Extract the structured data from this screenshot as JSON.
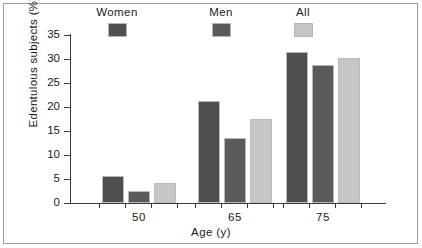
{
  "chart_data": {
    "type": "bar",
    "title": "",
    "subtitle": "",
    "xlabel": "Age (y)",
    "ylabel": "Edentulous subjects (%)",
    "categories": [
      "50",
      "65",
      "75"
    ],
    "series": [
      {
        "name": "Women",
        "color": "#4f4f4f",
        "values": [
          5.7,
          21.2,
          31.4
        ]
      },
      {
        "name": "Men",
        "color": "#5a5a5a",
        "values": [
          2.5,
          13.6,
          28.7
        ]
      },
      {
        "name": "All",
        "color": "#c6c6c6",
        "values": [
          4.2,
          17.6,
          30.2
        ]
      }
    ],
    "ylim": [
      0,
      35
    ],
    "yticks": [
      0,
      5,
      10,
      15,
      20,
      25,
      30,
      35
    ],
    "ytick_labels": [
      "0",
      "5",
      "10",
      "15",
      "20",
      "25",
      "30",
      "35"
    ],
    "grid": false,
    "legend_position": "top"
  },
  "legend": {
    "items": [
      {
        "label": "Women",
        "color": "#4f4f4f"
      },
      {
        "label": "Men",
        "color": "#5a5a5a"
      },
      {
        "label": "All",
        "color": "#c6c6c6"
      }
    ]
  },
  "axes": {
    "x_title": "Age (y)",
    "y_title": "Edentulous subjects (%)",
    "group_labels": [
      "50",
      "65",
      "75"
    ],
    "y_tick_labels": [
      "35",
      "30",
      "25",
      "20",
      "15",
      "10",
      "5",
      "0"
    ]
  },
  "colors": {
    "women": "#4f4f4f",
    "men": "#5a5a5a",
    "all": "#c6c6c6",
    "axis": "#3a3a3a",
    "frame": "#9a9a9a",
    "background": "#ffffff",
    "text": "#1a1a1a"
  }
}
